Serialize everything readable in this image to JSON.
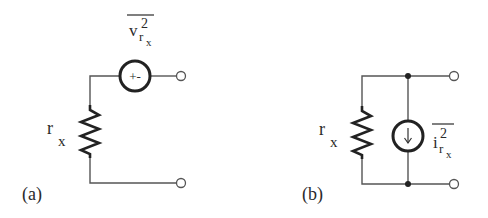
{
  "figure": {
    "panel_a": {
      "tag": "(a)",
      "resistor_label": {
        "base": "r",
        "sub": "x"
      },
      "source_label": {
        "base": "v",
        "sup": "2",
        "sub_base": "r",
        "sub_sub": "x",
        "overline": true
      },
      "source_type": "voltage-source",
      "source_glyph": "+-"
    },
    "panel_b": {
      "tag": "(b)",
      "resistor_label": {
        "base": "r",
        "sub": "x"
      },
      "source_label": {
        "base": "i",
        "sup": "2",
        "sub_base": "r",
        "sub_sub": "x",
        "overline": true
      },
      "source_type": "current-source",
      "source_glyph": "down-arrow"
    }
  },
  "colors": {
    "wire": "#555555",
    "ink": "#2a2a2a",
    "background": "#ffffff"
  }
}
